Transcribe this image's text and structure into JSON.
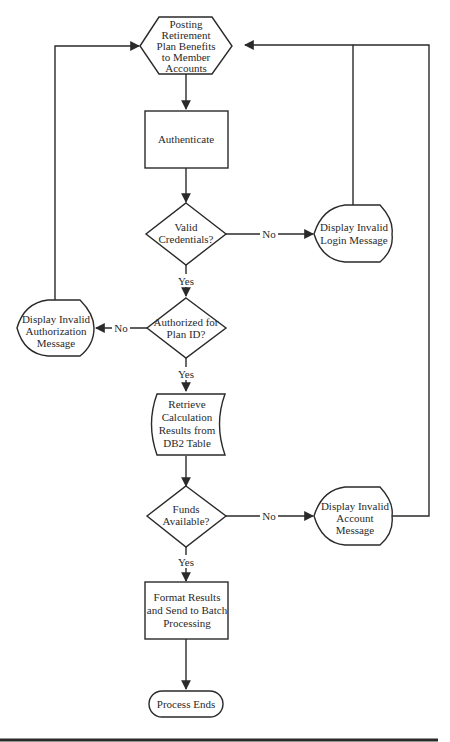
{
  "diagram": {
    "type": "flowchart",
    "nodes": {
      "start": {
        "shape": "hexagon",
        "lines": [
          "Posting",
          "Retirement",
          "Plan Benefits",
          "to Member",
          "Accounts"
        ]
      },
      "authenticate": {
        "shape": "process",
        "lines": [
          "Authenticate"
        ]
      },
      "valid_credentials": {
        "shape": "decision",
        "lines": [
          "Valid",
          "Credentials?"
        ]
      },
      "invalid_login": {
        "shape": "display",
        "lines": [
          "Display Invalid",
          "Login Message"
        ]
      },
      "authorized": {
        "shape": "decision",
        "lines": [
          "Authorized for",
          "Plan ID?"
        ]
      },
      "invalid_authorization": {
        "shape": "display",
        "lines": [
          "Display Invalid",
          "Authorization",
          "Message"
        ]
      },
      "retrieve": {
        "shape": "stored-data",
        "lines": [
          "Retrieve",
          "Calculation",
          "Results from",
          "DB2 Table"
        ]
      },
      "funds_available": {
        "shape": "decision",
        "lines": [
          "Funds",
          "Available?"
        ]
      },
      "invalid_account": {
        "shape": "display",
        "lines": [
          "Display Invalid",
          "Account",
          "Message"
        ]
      },
      "format_results": {
        "shape": "process",
        "lines": [
          "Format Results",
          "and Send to Batch",
          "Processing"
        ]
      },
      "end": {
        "shape": "terminator",
        "lines": [
          "Process Ends"
        ]
      }
    },
    "edges": [
      {
        "from": "start",
        "to": "authenticate",
        "label": ""
      },
      {
        "from": "authenticate",
        "to": "valid_credentials",
        "label": ""
      },
      {
        "from": "valid_credentials",
        "to": "invalid_login",
        "label": "No"
      },
      {
        "from": "valid_credentials",
        "to": "authorized",
        "label": "Yes"
      },
      {
        "from": "invalid_login",
        "to": "start",
        "label": ""
      },
      {
        "from": "authorized",
        "to": "invalid_authorization",
        "label": "No"
      },
      {
        "from": "authorized",
        "to": "retrieve",
        "label": "Yes"
      },
      {
        "from": "invalid_authorization",
        "to": "start",
        "label": ""
      },
      {
        "from": "retrieve",
        "to": "funds_available",
        "label": ""
      },
      {
        "from": "funds_available",
        "to": "invalid_account",
        "label": "No"
      },
      {
        "from": "funds_available",
        "to": "format_results",
        "label": "Yes"
      },
      {
        "from": "invalid_account",
        "to": "start",
        "label": ""
      },
      {
        "from": "format_results",
        "to": "end",
        "label": ""
      }
    ],
    "labels": {
      "no_credentials": "No",
      "yes_credentials": "Yes",
      "no_authorized": "No",
      "yes_authorized": "Yes",
      "no_funds": "No",
      "yes_funds": "Yes"
    },
    "colors": {
      "stroke": "#2a2a2a",
      "fill": "#ffffff",
      "text": "#2a2a2a"
    }
  }
}
